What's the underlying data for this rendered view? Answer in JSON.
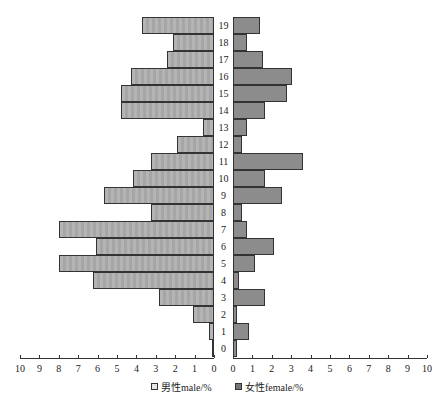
{
  "chart_data": {
    "type": "bar",
    "orientation": "horizontal-pyramid",
    "categories": [
      "0",
      "1",
      "2",
      "3",
      "4",
      "5",
      "6",
      "7",
      "8",
      "9",
      "10",
      "11",
      "12",
      "13",
      "14",
      "15",
      "16",
      "17",
      "18",
      "19"
    ],
    "series": [
      {
        "name": "男性male/%",
        "side": "left",
        "color": "#b0b0b0",
        "values": [
          0.1,
          0.25,
          1.1,
          2.85,
          6.25,
          8.0,
          6.1,
          8.0,
          3.25,
          5.65,
          4.2,
          3.25,
          1.9,
          0.55,
          4.8,
          4.8,
          4.3,
          2.4,
          2.1,
          3.7
        ]
      },
      {
        "name": "女性female/%",
        "side": "right",
        "color": "#8c8c8c",
        "values": [
          0.2,
          0.85,
          0.2,
          1.65,
          0.3,
          1.15,
          2.1,
          0.7,
          0.45,
          2.5,
          1.65,
          3.6,
          0.45,
          0.7,
          1.65,
          2.8,
          3.05,
          1.55,
          0.7,
          1.4
        ]
      }
    ],
    "left_axis_ticks": [
      "10",
      "9",
      "8",
      "7",
      "6",
      "5",
      "4",
      "3",
      "2",
      "1",
      "0"
    ],
    "right_axis_ticks": [
      "0",
      "1",
      "2",
      "3",
      "4",
      "5",
      "6",
      "7",
      "8",
      "9",
      "10"
    ],
    "xlim": [
      0,
      10
    ],
    "grid": false,
    "legend_position": "bottom"
  },
  "legend": {
    "male": "男性male/%",
    "female": "女性female/%"
  }
}
